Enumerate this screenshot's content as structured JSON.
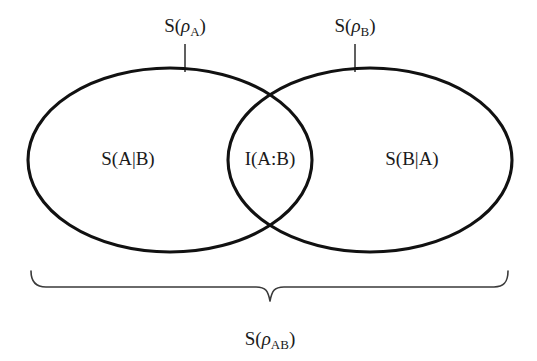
{
  "figure": {
    "background_color": "#ffffff",
    "stroke_color": "#111111",
    "text_color": "#1a1a1a",
    "brace_color": "#3a3a3a"
  },
  "top_labels": {
    "left": {
      "full_text": "S(ρA)",
      "prefix": "S(",
      "symbol": "ρ",
      "subscript": "A",
      "suffix": ")"
    },
    "right": {
      "full_text": "S(ρB)",
      "prefix": "S(",
      "symbol": "ρ",
      "subscript": "B",
      "suffix": ")"
    }
  },
  "regions": {
    "left_only": {
      "label": "S(A|B)",
      "meaning": "conditional-entropy-a-given-b"
    },
    "intersection": {
      "label": "I(A:B)",
      "meaning": "mutual-information"
    },
    "right_only": {
      "label": "S(B|A)",
      "meaning": "conditional-entropy-b-given-a"
    }
  },
  "bottom_label": {
    "full_text": "S(ρAB)",
    "prefix": "S(",
    "symbol": "ρ",
    "subscript": "AB",
    "suffix": ")"
  },
  "geometry": {
    "left_ellipse": {
      "cx": 170,
      "cy": 160,
      "rx": 142,
      "ry": 92
    },
    "right_ellipse": {
      "cx": 370,
      "cy": 160,
      "rx": 142,
      "ry": 92
    },
    "brace": {
      "x_start": 30,
      "x_end": 508,
      "y_top": 270,
      "y_stem": 301,
      "x_center": 270
    }
  }
}
